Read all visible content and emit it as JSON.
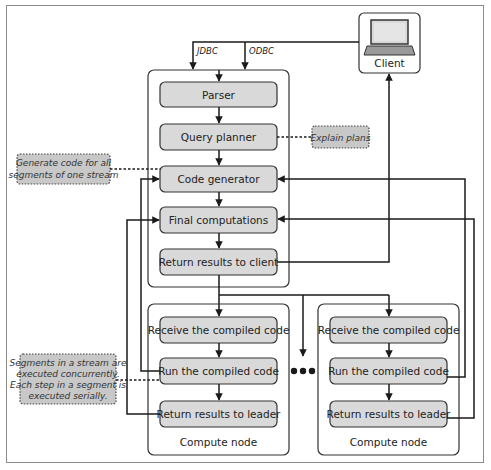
{
  "diagram": {
    "client": {
      "label": "Client",
      "icon": "laptop-icon"
    },
    "connectors": {
      "jdbc": "JDBC",
      "odbc": "ODBC"
    },
    "leader": {
      "steps": [
        {
          "label": "Parser"
        },
        {
          "label": "Query planner"
        },
        {
          "label": "Code generator"
        },
        {
          "label": "Final computations"
        },
        {
          "label": "Return results to client"
        }
      ]
    },
    "compute_nodes": [
      {
        "label": "Compute node",
        "steps": [
          {
            "label": "Receive the compiled code"
          },
          {
            "label": "Run the compiled code"
          },
          {
            "label": "Return results to leader"
          }
        ]
      },
      {
        "label": "Compute node",
        "steps": [
          {
            "label": "Receive the compiled code"
          },
          {
            "label": "Run the compiled code"
          },
          {
            "label": "Return results to leader"
          }
        ]
      }
    ],
    "notes": {
      "explain_plans": "Explain plans",
      "generate_code": [
        "Generate code for all",
        "segments of one stream"
      ],
      "segments": [
        "Segments in a stream are",
        "executed concurrently.",
        "Each step in a segment is",
        "executed serially."
      ]
    },
    "colors": {
      "step_fill": "#d9d9d9",
      "note_fill": "#c8c8c8",
      "line": "#1a1a1a",
      "frame": "#8c8c8c"
    }
  }
}
